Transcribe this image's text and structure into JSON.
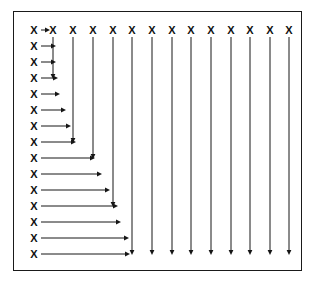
{
  "figure": {
    "node_glyph": "X",
    "frame": {
      "x": 13,
      "y": 11,
      "width": 289,
      "height": 260,
      "border_color": "#1a1a1a",
      "border_width": 1,
      "background_color": "#ffffff"
    },
    "colors": {
      "ink": "#161616",
      "glyph": "#111111",
      "background": "#ffffff"
    },
    "geometry": {
      "top_row_y": 30,
      "left_col_x": 34,
      "col_start_x": 34,
      "col_step": 19.4,
      "row_start_y": 30,
      "row_step": 16.0,
      "column_count": 14,
      "row_count": 15,
      "arrow_head_length": 5,
      "arrow_head_halfwidth": 2.4
    },
    "top_row_nodes": [
      {
        "index": 0,
        "label": "X",
        "x": 34,
        "y": 30
      },
      {
        "index": 1,
        "label": "X",
        "x": 53,
        "y": 30
      },
      {
        "index": 2,
        "label": "X",
        "x": 73,
        "y": 30
      },
      {
        "index": 3,
        "label": "X",
        "x": 93,
        "y": 30
      },
      {
        "index": 4,
        "label": "X",
        "x": 113,
        "y": 30
      },
      {
        "index": 5,
        "label": "X",
        "x": 132,
        "y": 30
      },
      {
        "index": 6,
        "label": "X",
        "x": 152,
        "y": 30
      },
      {
        "index": 7,
        "label": "X",
        "x": 172,
        "y": 30
      },
      {
        "index": 8,
        "label": "X",
        "x": 191,
        "y": 30
      },
      {
        "index": 9,
        "label": "X",
        "x": 211,
        "y": 30
      },
      {
        "index": 10,
        "label": "X",
        "x": 231,
        "y": 30
      },
      {
        "index": 11,
        "label": "X",
        "x": 250,
        "y": 30
      },
      {
        "index": 12,
        "label": "X",
        "x": 270,
        "y": 30
      },
      {
        "index": 13,
        "label": "X",
        "x": 289,
        "y": 30
      }
    ],
    "left_column_nodes": [
      {
        "index": 0,
        "label": "X",
        "x": 34,
        "y": 30
      },
      {
        "index": 1,
        "label": "X",
        "x": 34,
        "y": 46
      },
      {
        "index": 2,
        "label": "X",
        "x": 34,
        "y": 62
      },
      {
        "index": 3,
        "label": "X",
        "x": 34,
        "y": 78
      },
      {
        "index": 4,
        "label": "X",
        "x": 34,
        "y": 94
      },
      {
        "index": 5,
        "label": "X",
        "x": 34,
        "y": 110
      },
      {
        "index": 6,
        "label": "X",
        "x": 34,
        "y": 126
      },
      {
        "index": 7,
        "label": "X",
        "x": 34,
        "y": 142
      },
      {
        "index": 8,
        "label": "X",
        "x": 34,
        "y": 158
      },
      {
        "index": 9,
        "label": "X",
        "x": 34,
        "y": 174
      },
      {
        "index": 10,
        "label": "X",
        "x": 34,
        "y": 190
      },
      {
        "index": 11,
        "label": "X",
        "x": 34,
        "y": 206
      },
      {
        "index": 12,
        "label": "X",
        "x": 34,
        "y": 222
      },
      {
        "index": 13,
        "label": "X",
        "x": 34,
        "y": 238
      },
      {
        "index": 14,
        "label": "X",
        "x": 34,
        "y": 254
      }
    ],
    "horizontal_arrows": [
      {
        "row": 0,
        "x1": 41,
        "x2": 50,
        "y": 30
      },
      {
        "row": 1,
        "x1": 41,
        "x2": 56,
        "y": 46
      },
      {
        "row": 2,
        "x1": 41,
        "x2": 56,
        "y": 62
      },
      {
        "row": 3,
        "x1": 41,
        "x2": 58,
        "y": 78
      },
      {
        "row": 4,
        "x1": 41,
        "x2": 60,
        "y": 94
      },
      {
        "row": 5,
        "x1": 41,
        "x2": 66,
        "y": 110
      },
      {
        "row": 6,
        "x1": 41,
        "x2": 71,
        "y": 126
      },
      {
        "row": 7,
        "x1": 41,
        "x2": 76,
        "y": 142
      },
      {
        "row": 8,
        "x1": 41,
        "x2": 95,
        "y": 158
      },
      {
        "row": 9,
        "x1": 41,
        "x2": 102,
        "y": 174
      },
      {
        "row": 10,
        "x1": 41,
        "x2": 110,
        "y": 190
      },
      {
        "row": 11,
        "x1": 41,
        "x2": 118,
        "y": 206
      },
      {
        "row": 12,
        "x1": 41,
        "x2": 121,
        "y": 222
      },
      {
        "row": 13,
        "x1": 41,
        "x2": 129,
        "y": 238
      },
      {
        "row": 14,
        "x1": 41,
        "x2": 130,
        "y": 254
      }
    ],
    "vertical_arrows": [
      {
        "col": 1,
        "x": 53,
        "y1": 37,
        "y2": 79
      },
      {
        "col": 2,
        "x": 73,
        "y1": 37,
        "y2": 143
      },
      {
        "col": 3,
        "x": 93,
        "y1": 37,
        "y2": 159
      },
      {
        "col": 4,
        "x": 113,
        "y1": 37,
        "y2": 207
      },
      {
        "col": 5,
        "x": 132,
        "y1": 37,
        "y2": 255
      },
      {
        "col": 6,
        "x": 152,
        "y1": 37,
        "y2": 255
      },
      {
        "col": 7,
        "x": 172,
        "y1": 37,
        "y2": 255
      },
      {
        "col": 8,
        "x": 191,
        "y1": 37,
        "y2": 255
      },
      {
        "col": 9,
        "x": 211,
        "y1": 37,
        "y2": 255
      },
      {
        "col": 10,
        "x": 231,
        "y1": 37,
        "y2": 255
      },
      {
        "col": 11,
        "x": 250,
        "y1": 37,
        "y2": 255
      },
      {
        "col": 12,
        "x": 270,
        "y1": 37,
        "y2": 255
      },
      {
        "col": 13,
        "x": 289,
        "y1": 37,
        "y2": 255
      }
    ]
  }
}
